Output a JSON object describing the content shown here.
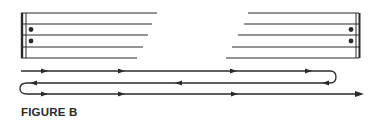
{
  "figure": {
    "caption": "FIGURE B",
    "ink_color": "#2a2a2a",
    "left_staff": {
      "description": "Opening staff with begin-repeat sign (thick + thin barline, two dots)",
      "lines_y": [
        13,
        24,
        35,
        47,
        58
      ],
      "lines_end_x": [
        157,
        152,
        148,
        143,
        137
      ],
      "repeat_sign": "begin-repeat"
    },
    "right_staff": {
      "description": "Closing staff with end-repeat sign (two dots, thin + thick barline)",
      "lines_y": [
        13,
        24,
        35,
        47,
        58
      ],
      "lines_start_x": [
        248,
        244,
        238,
        232,
        226
      ],
      "repeat_sign": "end-repeat"
    },
    "playback_path": {
      "description": "Reading path: play through, repeat back to start, play through again and continue",
      "segments": [
        {
          "direction": "right",
          "y": 71,
          "arrows_x": [
            45,
            122,
            234,
            309
          ]
        },
        {
          "direction": "left",
          "y": 83,
          "arrows_x": [
            325,
            178,
            32
          ]
        },
        {
          "direction": "right",
          "y": 94,
          "arrows_x": [
            45,
            122,
            235,
            360
          ]
        }
      ]
    }
  }
}
